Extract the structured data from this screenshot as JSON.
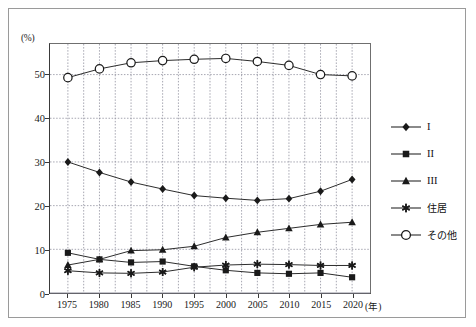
{
  "chart_data": {
    "type": "line",
    "title": "",
    "subtitle": "",
    "xlabel": "年",
    "ylabel": "(%)",
    "y_unit_label": "(%)",
    "x_unit_label": "(年)",
    "grid": true,
    "legend_position": "right",
    "xlim": [
      1975,
      2020
    ],
    "ylim": [
      0,
      57
    ],
    "y_ticks": [
      0,
      10,
      20,
      30,
      40,
      50
    ],
    "y_tick_labels": [
      "0",
      "10",
      "20",
      "30",
      "40",
      "50"
    ],
    "categories": [
      1975,
      1980,
      1985,
      1990,
      1995,
      2000,
      2005,
      2010,
      2015,
      2020
    ],
    "x_tick_labels": [
      "1975",
      "1980",
      "1985",
      "1990",
      "1995",
      "2000",
      "2005",
      "2010",
      "2015",
      "2020"
    ],
    "series": [
      {
        "name": "I",
        "marker": "diamond",
        "values": [
          30.0,
          27.6,
          25.4,
          23.8,
          22.3,
          21.7,
          21.2,
          21.6,
          23.3,
          26.0
        ]
      },
      {
        "name": "II",
        "marker": "square",
        "values": [
          9.2,
          7.7,
          7.0,
          7.2,
          6.1,
          5.2,
          4.6,
          4.4,
          4.6,
          3.6
        ]
      },
      {
        "name": "III",
        "marker": "triangle",
        "values": [
          6.4,
          7.7,
          9.7,
          9.9,
          10.7,
          12.7,
          13.9,
          14.8,
          15.7,
          16.2
        ]
      },
      {
        "name": "住居",
        "marker": "asterisk",
        "values": [
          5.1,
          4.6,
          4.5,
          4.8,
          5.9,
          6.4,
          6.6,
          6.5,
          6.3,
          6.3
        ]
      },
      {
        "name": "その他",
        "marker": "circle-open",
        "values": [
          49.3,
          51.3,
          52.7,
          53.2,
          53.5,
          53.7,
          53.0,
          52.1,
          50.0,
          49.7
        ]
      }
    ]
  },
  "legend": {
    "entries": [
      {
        "label": "I",
        "marker": "diamond"
      },
      {
        "label": "II",
        "marker": "square"
      },
      {
        "label": "III",
        "marker": "triangle"
      },
      {
        "label": "住居",
        "marker": "asterisk"
      },
      {
        "label": "その他",
        "marker": "circle-open"
      }
    ]
  },
  "colors": {
    "line": "#2b2b2b",
    "marker_fill": "#1a1a1a",
    "marker_open_fill": "#ffffff",
    "grid": "#8f8f9c",
    "axis": "#3a3a3a",
    "frame": "#9a9a9a",
    "text": "#1a1a1a"
  }
}
